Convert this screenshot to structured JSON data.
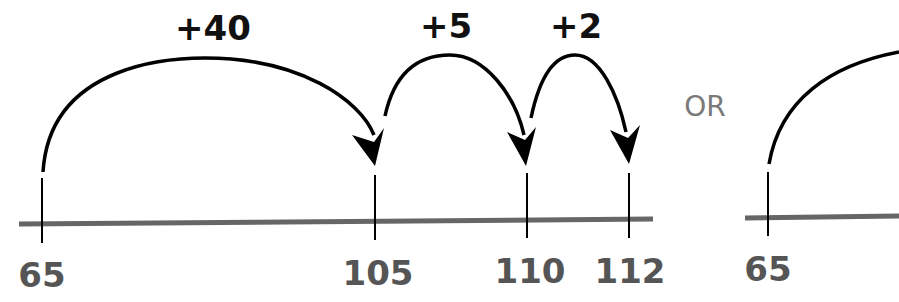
{
  "diagram": {
    "type": "number-line-jumps",
    "colors": {
      "line": "#666666",
      "arc": "#000000",
      "tick_label": "#555555",
      "jump_label": "#111111",
      "or_label": "#7a7a7a"
    },
    "left_line": {
      "ticks": [
        {
          "value": "65",
          "x": 42
        },
        {
          "value": "105",
          "x": 375
        },
        {
          "value": "110",
          "x": 527
        },
        {
          "value": "112",
          "x": 629
        }
      ],
      "jumps": [
        {
          "label": "+40",
          "from": "65",
          "to": "105"
        },
        {
          "label": "+5",
          "from": "105",
          "to": "110"
        },
        {
          "label": "+2",
          "from": "110",
          "to": "112"
        }
      ]
    },
    "separator": "OR",
    "right_line": {
      "ticks": [
        {
          "value": "65",
          "x": 768
        }
      ]
    }
  }
}
